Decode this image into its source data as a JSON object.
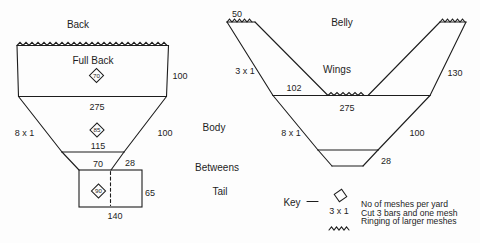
{
  "colors": {
    "ink": "#1d1d1d",
    "background": "#fdfdfd"
  },
  "back_panel": {
    "title": "Back",
    "full_back": {
      "label": "Full Back",
      "mesh_per_yard": "70",
      "depth": "100",
      "bottom_width": "275"
    },
    "body": {
      "cut_rate": "8 x 1",
      "mesh_per_yard": "85",
      "depth": "100",
      "bottom_width": "115"
    },
    "betweens": {
      "bottom_width": "70",
      "depth": "28"
    },
    "tail": {
      "mesh_per_yard": "90",
      "depth": "65",
      "width": "140"
    }
  },
  "section_labels": {
    "body": "Body",
    "betweens": "Betweens",
    "tail": "Tail"
  },
  "belly_panel": {
    "title": "Belly",
    "wings": {
      "label": "Wings",
      "tip_width": "50",
      "cut_rate": "3 x 1",
      "depth": "130",
      "bottom_width": "102"
    },
    "body": {
      "top_width": "275",
      "cut_rate": "8 x 1",
      "depth": "100"
    },
    "betweens": {
      "depth": "28"
    }
  },
  "key": {
    "label": "Key",
    "rows": [
      {
        "symbol": "diamond",
        "text": "No of meshes per yard"
      },
      {
        "symbol": "3 x 1",
        "text": "Cut 3 bars and one mesh"
      },
      {
        "symbol": "zigzag",
        "text": "Ringing of larger meshes"
      }
    ]
  }
}
